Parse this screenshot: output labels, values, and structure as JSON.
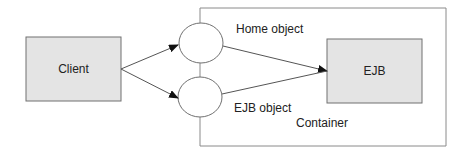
{
  "diagram": {
    "nodes": {
      "client": {
        "label": "Client"
      },
      "ejb": {
        "label": "EJB"
      },
      "home_object": {
        "label": "Home object"
      },
      "ejb_object": {
        "label": "EJB object"
      },
      "container": {
        "label": "Container"
      }
    },
    "edges": [
      {
        "from": "Client",
        "to": "Home object"
      },
      {
        "from": "Client",
        "to": "EJB object"
      },
      {
        "from": "Home object",
        "to": "EJB"
      },
      {
        "from": "EJB object",
        "to": "EJB"
      }
    ],
    "colors": {
      "box_fill": "#e4e4e4",
      "stroke": "#707070",
      "arrow": "#111111",
      "background": "#ffffff"
    }
  }
}
